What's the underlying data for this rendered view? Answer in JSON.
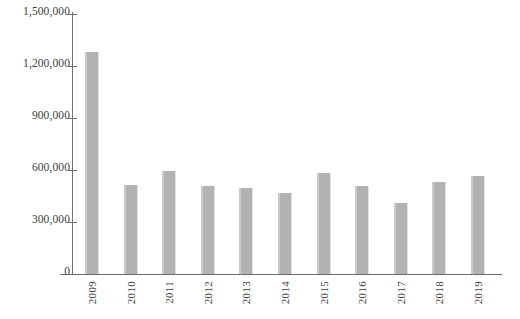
{
  "chart_data": {
    "type": "bar",
    "title": "",
    "subtitle": "",
    "xlabel": "",
    "ylabel": "",
    "categories": [
      "2009",
      "2010",
      "2011",
      "2012",
      "2013",
      "2014",
      "2015",
      "2016",
      "2017",
      "2018",
      "2019"
    ],
    "values": [
      1280000,
      515000,
      594000,
      510000,
      498000,
      470000,
      583000,
      510000,
      408000,
      532000,
      566000
    ],
    "ylim": [
      0,
      1500000
    ],
    "ytick_values": [
      0,
      300000,
      600000,
      900000,
      1200000,
      1500000
    ],
    "ytick_labels": [
      "0",
      "300,000",
      "600,000",
      "900,000",
      "1,200,000",
      "1,500,000"
    ],
    "grid": false,
    "legend": null,
    "bar_color": "#b2b2b2",
    "axis_color": "#6e6e6e",
    "background_color": "#ffffff"
  }
}
